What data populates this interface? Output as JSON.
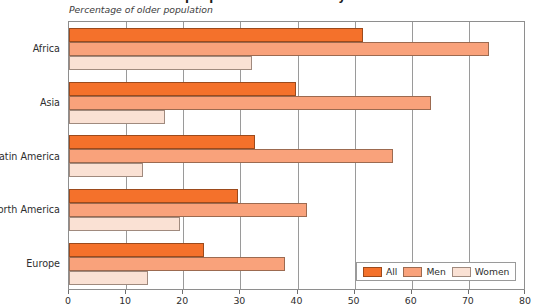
{
  "chart_data": {
    "type": "bar",
    "orientation": "horizontal",
    "title": "Older people are economically active",
    "subtitle": "Percentage of older population",
    "xlabel": "",
    "ylabel": "",
    "xlim": [
      0,
      80
    ],
    "xticks": [
      0,
      10,
      20,
      30,
      40,
      50,
      60,
      70,
      80
    ],
    "grid": true,
    "grid_axis": "x",
    "legend_position": "bottom-right",
    "categories": [
      "Africa",
      "Asia",
      "Latin America",
      "North America",
      "Europe"
    ],
    "series": [
      {
        "name": "All",
        "color": "#f4712b",
        "values": [
          51.5,
          39.7,
          32.6,
          29.6,
          23.7
        ]
      },
      {
        "name": "Men",
        "color": "#f9a27b",
        "values": [
          73.5,
          63.4,
          56.7,
          41.6,
          37.8
        ]
      },
      {
        "name": "Women",
        "color": "#fae1d4",
        "values": [
          32.0,
          16.8,
          13.0,
          19.5,
          13.8
        ]
      }
    ]
  },
  "legend": {
    "entries": [
      {
        "label": "All"
      },
      {
        "label": "Men"
      },
      {
        "label": "Women"
      }
    ]
  }
}
